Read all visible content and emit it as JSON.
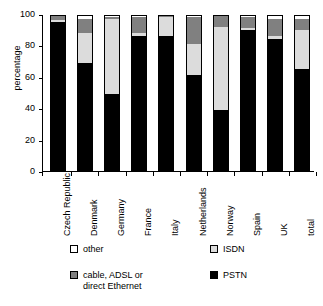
{
  "chart_data": {
    "type": "bar",
    "subtype": "stacked-bar",
    "title": "",
    "xlabel": "",
    "ylabel": "percentage",
    "ylim": [
      0,
      100
    ],
    "yticks": [
      0,
      20,
      40,
      60,
      80,
      100
    ],
    "grid": false,
    "legend_position": "bottom",
    "categories": [
      "Czech Republic",
      "Denmark",
      "Germany",
      "France",
      "Italy",
      "Netherlands",
      "Norway",
      "Spain",
      "UK",
      "total"
    ],
    "series": [
      {
        "name": "PSTN",
        "color": "#000000",
        "values": [
          95,
          69,
          49,
          86,
          86,
          61,
          39,
          90,
          84,
          65
        ]
      },
      {
        "name": "ISDN",
        "color": "#dcdcdc",
        "values": [
          1,
          19,
          48,
          2,
          12,
          20,
          53,
          1,
          2,
          25
        ]
      },
      {
        "name": "cable, ADSL or direct Ethernet",
        "color": "#808080",
        "values": [
          3,
          9,
          1,
          10,
          1,
          17,
          7,
          7,
          11,
          7
        ]
      },
      {
        "name": "other",
        "color": "#ffffff",
        "values": [
          1,
          3,
          2,
          2,
          1,
          2,
          1,
          2,
          3,
          3
        ]
      }
    ]
  },
  "axis": {
    "y_label": "percentage",
    "y_tick_labels": [
      "100",
      "80",
      "60",
      "40",
      "20",
      "0"
    ]
  },
  "legend": {
    "items": [
      {
        "label": "other",
        "swatch": "white-square-icon"
      },
      {
        "label": "ISDN",
        "swatch": "light-gray-square-icon"
      },
      {
        "label": "cable, ADSL or",
        "label_line2": "direct Ethernet",
        "swatch": "gray-square-icon"
      },
      {
        "label": "PSTN",
        "swatch": "black-square-icon"
      }
    ]
  }
}
